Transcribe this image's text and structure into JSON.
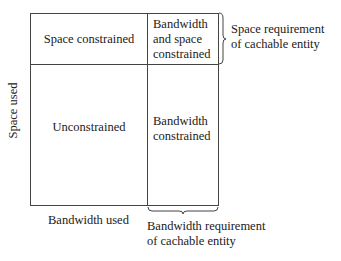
{
  "diagram": {
    "cells": {
      "top_left": "Space constrained",
      "top_right": [
        "Bandwidth",
        "and space",
        "constrained"
      ],
      "bottom_left": "Unconstrained",
      "bottom_right": [
        "Bandwidth",
        "constrained"
      ]
    },
    "axes": {
      "y_label": "Space used",
      "x_label": "Bandwidth used"
    },
    "annotations": {
      "space_requirement": [
        "Space requirement",
        "of cachable entity"
      ],
      "bandwidth_requirement": [
        "Bandwidth requirement",
        "of cachable entity"
      ]
    },
    "colors": {
      "line": "#444444",
      "text": "#1a1a1a",
      "background": "#ffffff"
    }
  }
}
